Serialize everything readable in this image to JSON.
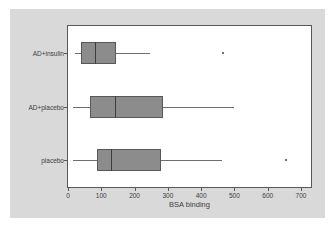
{
  "chart_data": {
    "type": "boxplot",
    "title": "",
    "xlabel": "BSA binding",
    "ylabel": "",
    "orientation": "horizontal",
    "xlim": [
      0,
      730
    ],
    "xticks": [
      0,
      100,
      200,
      300,
      400,
      500,
      600,
      700
    ],
    "xtick_labels": [
      "0",
      "100",
      "200",
      "300",
      "400",
      "500",
      "600",
      "700"
    ],
    "categories": [
      "AD+insulin",
      "AD+placebo",
      "placebo"
    ],
    "grid": false,
    "legend": null,
    "colors": {
      "box_fill": "#8c8c8c",
      "box_edge": "#58585a",
      "median": "#3d3d3f",
      "whisker": "#6e6e70",
      "outlier": "#6e6e70",
      "panel_background": "#d9d9d9",
      "plot_background": "#ffffff"
    },
    "boxes": [
      {
        "category": "AD+insulin",
        "whisker_low": 20,
        "q1": 40,
        "median": 82,
        "q3": 145,
        "whisker_high": 245,
        "outliers": [
          465
        ]
      },
      {
        "category": "AD+placebo",
        "whisker_low": 15,
        "q1": 67,
        "median": 140,
        "q3": 285,
        "whisker_high": 500,
        "outliers": []
      },
      {
        "category": "placebo",
        "whisker_low": 15,
        "q1": 88,
        "median": 130,
        "q3": 280,
        "whisker_high": 462,
        "outliers": [
          655
        ]
      }
    ]
  }
}
